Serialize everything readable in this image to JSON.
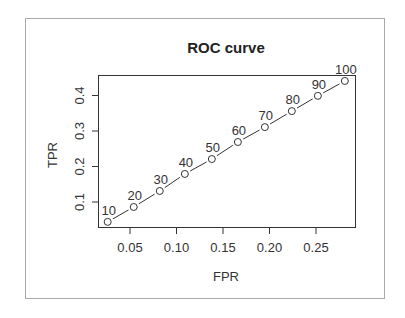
{
  "chart_data": {
    "type": "line",
    "title": "ROC curve",
    "xlabel": "FPR",
    "ylabel": "TPR",
    "xlim": [
      0.02,
      0.29
    ],
    "ylim": [
      0.03,
      0.46
    ],
    "x_ticks": [
      0.05,
      0.1,
      0.15,
      0.2,
      0.25
    ],
    "x_tick_labels": [
      "0.05",
      "0.10",
      "0.15",
      "0.20",
      "0.25"
    ],
    "y_ticks": [
      0.1,
      0.2,
      0.3,
      0.4
    ],
    "y_tick_labels": [
      "0.1",
      "0.2",
      "0.3",
      "0.4"
    ],
    "grid": false,
    "legend": null,
    "marker": "open-circle",
    "series": [
      {
        "name": "ROC",
        "x": [
          0.026,
          0.054,
          0.082,
          0.109,
          0.138,
          0.166,
          0.195,
          0.224,
          0.252,
          0.281
        ],
        "y": [
          0.044,
          0.086,
          0.131,
          0.179,
          0.221,
          0.269,
          0.311,
          0.356,
          0.399,
          0.441
        ],
        "point_labels": [
          "10",
          "20",
          "30",
          "40",
          "50",
          "60",
          "70",
          "80",
          "90",
          "100"
        ]
      }
    ]
  },
  "colors": {
    "line": "#333333",
    "frame": "#aaaaaa",
    "plot_box": "#333333",
    "text": "#333333"
  }
}
